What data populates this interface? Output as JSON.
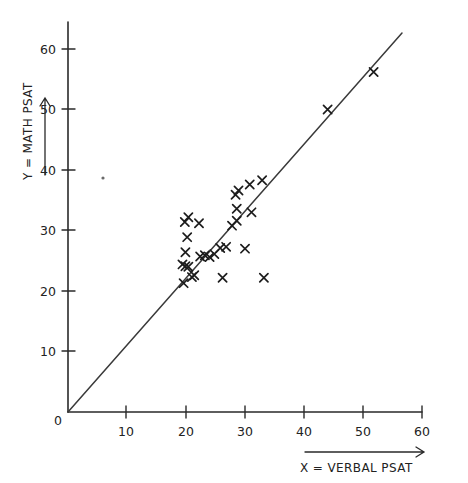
{
  "chart_data": {
    "type": "scatter",
    "title": "",
    "xlabel": "X = VERBAL PSAT",
    "ylabel": "Y = MATH PSAT",
    "xlim": [
      0,
      64
    ],
    "ylim": [
      0,
      65
    ],
    "grid": false,
    "legend": "none",
    "xticks": [
      10,
      20,
      30,
      40,
      50,
      60
    ],
    "yticks": [
      10,
      20,
      30,
      40,
      50,
      60
    ],
    "origin_label": "0",
    "marker": "x",
    "reference_line": {
      "label": "y = x",
      "x": [
        0,
        56.5
      ],
      "y": [
        0,
        63
      ]
    },
    "points": [
      {
        "x": 19.8,
        "y": 31.4
      },
      {
        "x": 20.4,
        "y": 32.2
      },
      {
        "x": 22.2,
        "y": 31.2
      },
      {
        "x": 20.2,
        "y": 28.9
      },
      {
        "x": 19.9,
        "y": 26.4
      },
      {
        "x": 19.4,
        "y": 24.4
      },
      {
        "x": 19.9,
        "y": 24.1
      },
      {
        "x": 20.4,
        "y": 24.0
      },
      {
        "x": 19.6,
        "y": 21.3
      },
      {
        "x": 21.0,
        "y": 22.3
      },
      {
        "x": 21.4,
        "y": 22.6
      },
      {
        "x": 22.4,
        "y": 25.7
      },
      {
        "x": 23.2,
        "y": 25.9
      },
      {
        "x": 24.0,
        "y": 25.6
      },
      {
        "x": 24.8,
        "y": 26.1
      },
      {
        "x": 25.8,
        "y": 27.1
      },
      {
        "x": 26.8,
        "y": 27.3
      },
      {
        "x": 27.8,
        "y": 30.8
      },
      {
        "x": 28.6,
        "y": 31.6
      },
      {
        "x": 28.4,
        "y": 35.9
      },
      {
        "x": 28.9,
        "y": 36.6
      },
      {
        "x": 28.6,
        "y": 33.6
      },
      {
        "x": 30.8,
        "y": 37.6
      },
      {
        "x": 31.1,
        "y": 33.0
      },
      {
        "x": 30.0,
        "y": 27.0
      },
      {
        "x": 32.9,
        "y": 38.3
      },
      {
        "x": 33.2,
        "y": 22.2
      },
      {
        "x": 26.2,
        "y": 22.2
      },
      {
        "x": 44.0,
        "y": 50.0
      },
      {
        "x": 51.8,
        "y": 56.2
      }
    ],
    "artifact_dot": {
      "x": 8.0,
      "y": 39.0
    }
  }
}
